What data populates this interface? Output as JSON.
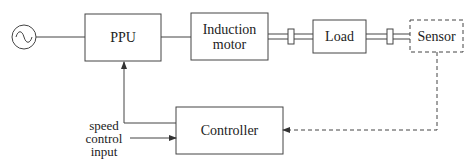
{
  "blocks": {
    "ppu": "PPU",
    "motor_line1": "Induction",
    "motor_line2": "motor",
    "load": "Load",
    "sensor": "Sensor",
    "controller": "Controller"
  },
  "input_label": {
    "line1": "speed",
    "line2": "control",
    "line3": "input"
  },
  "colors": {
    "stroke": "#333333",
    "text": "#222222"
  }
}
